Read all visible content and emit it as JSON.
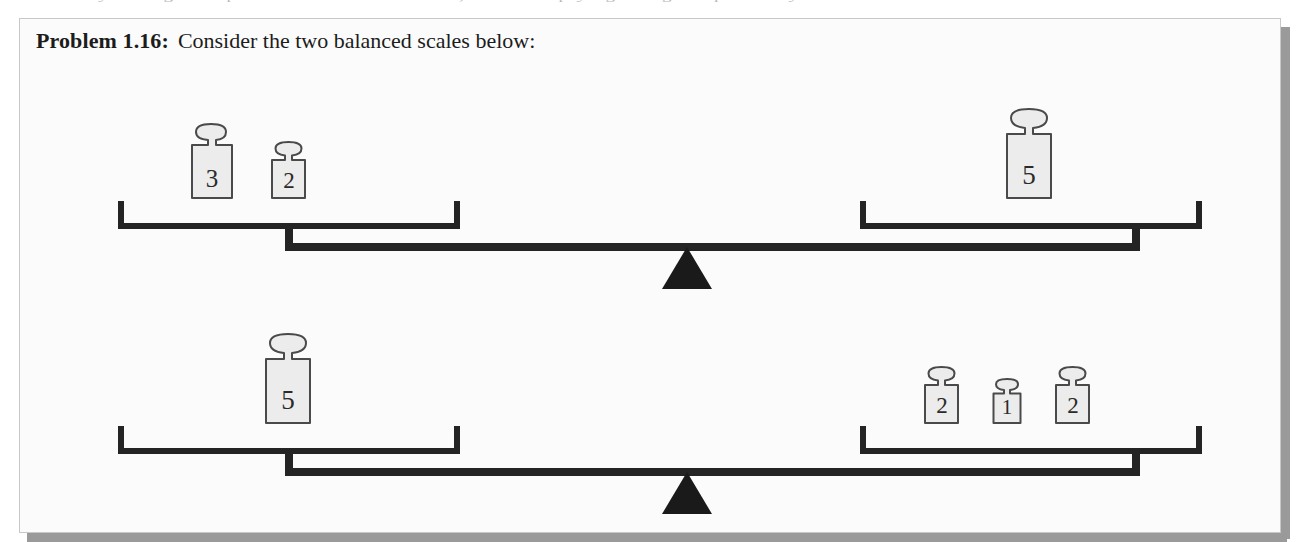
{
  "page": {
    "partial_line_above": "y through the problem to its conclusion, and multiplying along the path only at the"
  },
  "problem": {
    "label": "Problem 1.16:",
    "text": "Consider the two balanced scales below:"
  },
  "colors": {
    "ink": "#242424",
    "box_background": "#fbfbfb",
    "box_border": "#c8c8c8",
    "shadow": "#9a9a9a",
    "weight_fill": "#ececec",
    "weight_stroke": "#4a4a4a",
    "fulcrum": "#1a1a1a"
  },
  "scales": [
    {
      "name": "scale-1",
      "left_pan": {
        "name": "left-pan",
        "weights": [
          {
            "value": "3",
            "size": "large"
          },
          {
            "value": "2",
            "size": "medium"
          }
        ]
      },
      "right_pan": {
        "name": "right-pan",
        "weights": [
          {
            "value": "5",
            "size": "xlarge"
          }
        ]
      }
    },
    {
      "name": "scale-2",
      "left_pan": {
        "name": "left-pan",
        "weights": [
          {
            "value": "5",
            "size": "xlarge"
          }
        ]
      },
      "right_pan": {
        "name": "right-pan",
        "weights": [
          {
            "value": "2",
            "size": "medium"
          },
          {
            "value": "1",
            "size": "small"
          },
          {
            "value": "2",
            "size": "medium"
          }
        ]
      }
    }
  ]
}
